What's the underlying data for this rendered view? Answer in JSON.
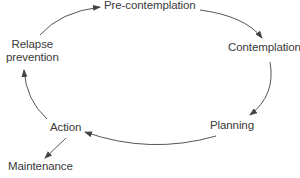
{
  "diagram": {
    "type": "cycle",
    "line_color": "#555555",
    "text_color": "#3a3a3a",
    "nodes": [
      {
        "id": "precontemplation",
        "label": "Pre-contemplation"
      },
      {
        "id": "contemplation",
        "label": "Contemplation"
      },
      {
        "id": "planning",
        "label": "Planning"
      },
      {
        "id": "action",
        "label": "Action"
      },
      {
        "id": "relapse",
        "label_line1": "Relapse",
        "label_line2": "prevention"
      },
      {
        "id": "maintenance",
        "label": "Maintenance"
      }
    ],
    "edges": [
      {
        "from": "precontemplation",
        "to": "contemplation"
      },
      {
        "from": "contemplation",
        "to": "planning"
      },
      {
        "from": "planning",
        "to": "action"
      },
      {
        "from": "action",
        "to": "relapse"
      },
      {
        "from": "relapse",
        "to": "precontemplation"
      },
      {
        "from": "action",
        "to": "maintenance"
      }
    ]
  }
}
